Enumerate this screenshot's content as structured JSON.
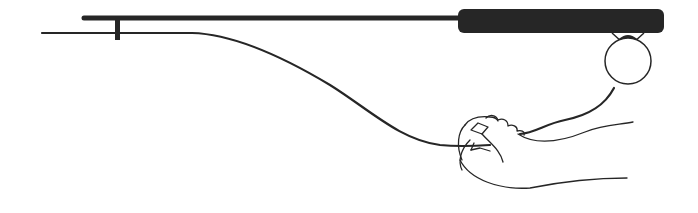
{
  "figure": {
    "type": "line-drawing",
    "description": "Fishing rod with reel held, line running to a hand",
    "colors": {
      "ink": "#262626",
      "background": "#ffffff"
    },
    "elements": {
      "rod": "rod-shaft",
      "handle": "rod-handle",
      "reel": "reel-circle",
      "line": "fishing-line",
      "hand": "hand"
    }
  }
}
